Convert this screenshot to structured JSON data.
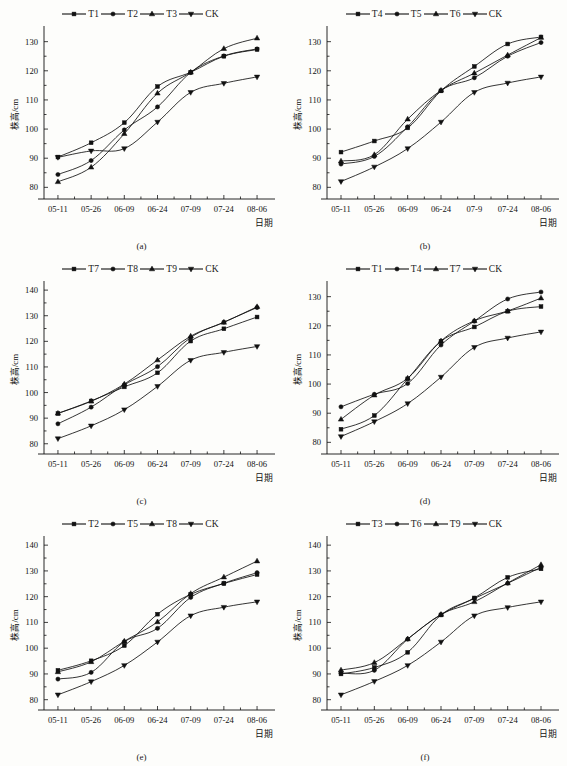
{
  "figure": {
    "y_axis_label": "株高/cm",
    "x_axis_label": "日期",
    "dates": [
      "05-11",
      "05-26",
      "06-09",
      "06-24",
      "07-09",
      "07-24",
      "08-06"
    ],
    "control_label": "CK",
    "footnote": ""
  },
  "chart_data": [
    {
      "type": "line",
      "panel": "a",
      "caption": "(a)",
      "title": "",
      "xlabel": "日期",
      "ylabel": "株高/cm",
      "x": [
        "05-11",
        "05-26",
        "06-09",
        "06-24",
        "07-09",
        "07-24",
        "08-06"
      ],
      "xticklabels": [
        "05-11",
        "05-26",
        "06-09",
        "06-24",
        "07-09",
        "07-24",
        "08-06"
      ],
      "yticklabels": [
        "80",
        "90",
        "100",
        "110",
        "120",
        "130"
      ],
      "ylim": [
        76,
        134
      ],
      "yticks": [
        80,
        90,
        100,
        110,
        120,
        130
      ],
      "grid": false,
      "legend_position": "top-center",
      "series": [
        {
          "name": "T1",
          "marker": "square",
          "values": [
            90.4,
            95.3,
            102.2,
            114.6,
            119.5,
            125.0,
            127.3
          ]
        },
        {
          "name": "T2",
          "marker": "circle",
          "values": [
            84.4,
            89.2,
            99.7,
            107.6,
            119.4,
            125.1,
            127.5
          ]
        },
        {
          "name": "T3",
          "marker": "triangle-up",
          "values": [
            81.9,
            86.9,
            98.4,
            112.3,
            119.5,
            127.6,
            131.2
          ]
        },
        {
          "name": "CK",
          "marker": "triangle-down",
          "values": [
            90.3,
            92.5,
            93.3,
            102.4,
            112.6,
            115.7,
            117.9
          ]
        }
      ]
    },
    {
      "type": "line",
      "panel": "b",
      "caption": "(b)",
      "title": "",
      "xlabel": "日期",
      "ylabel": "株高/cm",
      "x": [
        "05-11",
        "05-26",
        "06-09",
        "06-24",
        "07-9",
        "07-24",
        "08-06"
      ],
      "xticklabels": [
        "05-11",
        "05-26",
        "06-09",
        "06-24",
        "07-9",
        "07-24",
        "08-06"
      ],
      "yticklabels": [
        "80",
        "90",
        "100",
        "110",
        "120",
        "130"
      ],
      "ylim": [
        76,
        134
      ],
      "yticks": [
        80,
        90,
        100,
        110,
        120,
        130
      ],
      "grid": false,
      "legend_position": "top-center",
      "series": [
        {
          "name": "T4",
          "marker": "square",
          "values": [
            92.1,
            95.9,
            100.4,
            113.1,
            121.5,
            129.2,
            131.6
          ]
        },
        {
          "name": "T5",
          "marker": "circle",
          "values": [
            88.0,
            90.6,
            100.8,
            113.2,
            117.6,
            125.0,
            129.7
          ]
        },
        {
          "name": "T6",
          "marker": "triangle-up",
          "values": [
            89.0,
            91.2,
            103.4,
            113.3,
            119.2,
            125.4,
            131.4
          ]
        },
        {
          "name": "CK",
          "marker": "triangle-down",
          "values": [
            82.0,
            87.0,
            93.3,
            102.4,
            112.6,
            115.8,
            117.9
          ]
        }
      ]
    },
    {
      "type": "line",
      "panel": "c",
      "caption": "(c)",
      "title": "",
      "xlabel": "日期",
      "ylabel": "株高/cm",
      "x": [
        "05-11",
        "05-26",
        "06-09",
        "06-24",
        "07-09",
        "07-24",
        "08-06"
      ],
      "xticklabels": [
        "05-11",
        "05-26",
        "06-09",
        "06-24",
        "07-09",
        "07-24",
        "08-06"
      ],
      "yticklabels": [
        "80",
        "90",
        "100",
        "110",
        "120",
        "130",
        "140"
      ],
      "ylim": [
        76,
        142
      ],
      "yticks": [
        80,
        90,
        100,
        110,
        120,
        130,
        140
      ],
      "grid": false,
      "legend_position": "top-center",
      "series": [
        {
          "name": "T7",
          "marker": "square",
          "values": [
            91.8,
            96.7,
            102.2,
            107.7,
            120.1,
            124.9,
            129.5
          ]
        },
        {
          "name": "T8",
          "marker": "circle",
          "values": [
            87.8,
            94.3,
            103.0,
            110.1,
            121.5,
            127.5,
            133.2
          ]
        },
        {
          "name": "T9",
          "marker": "triangle-up",
          "values": [
            91.9,
            96.6,
            103.3,
            112.7,
            122.0,
            127.4,
            133.5
          ]
        },
        {
          "name": "CK",
          "marker": "triangle-down",
          "values": [
            82.0,
            87.0,
            93.3,
            102.4,
            112.6,
            115.7,
            118.0
          ]
        }
      ]
    },
    {
      "type": "line",
      "panel": "d",
      "caption": "(d)",
      "title": "",
      "xlabel": "日期",
      "ylabel": "株高/cm",
      "x": [
        "05-11",
        "05-26",
        "06-09",
        "06-24",
        "07-09",
        "07-24",
        "08-06"
      ],
      "xticklabels": [
        "05-11",
        "05-26",
        "06-09",
        "06-24",
        "07-09",
        "07-24",
        "08-06"
      ],
      "yticklabels": [
        "80",
        "90",
        "100",
        "110",
        "120",
        "130"
      ],
      "ylim": [
        76,
        134
      ],
      "yticks": [
        80,
        90,
        100,
        110,
        120,
        130
      ],
      "grid": false,
      "legend_position": "top-center",
      "series": [
        {
          "name": "T1",
          "marker": "square",
          "values": [
            84.5,
            89.2,
            101.8,
            114.7,
            119.6,
            125.0,
            126.6
          ]
        },
        {
          "name": "T4",
          "marker": "circle",
          "values": [
            92.2,
            96.5,
            100.2,
            113.4,
            121.6,
            129.2,
            131.6
          ]
        },
        {
          "name": "T7",
          "marker": "triangle-up",
          "values": [
            87.9,
            96.2,
            102.0,
            114.8,
            121.7,
            125.1,
            129.5
          ]
        },
        {
          "name": "CK",
          "marker": "triangle-down",
          "values": [
            82.0,
            87.1,
            93.3,
            102.4,
            112.6,
            115.8,
            117.9
          ]
        }
      ]
    },
    {
      "type": "line",
      "panel": "e",
      "caption": "(e)",
      "title": "",
      "xlabel": "日期",
      "ylabel": "株高/cm",
      "x": [
        "05-11",
        "05-26",
        "06-09",
        "06-24",
        "07-09",
        "07-24",
        "08-06"
      ],
      "xticklabels": [
        "05-11",
        "05-26",
        "06-09",
        "06-24",
        "07-09",
        "07-24",
        "08-06"
      ],
      "yticklabels": [
        "80",
        "90",
        "100",
        "110",
        "120",
        "130",
        "140"
      ],
      "ylim": [
        76,
        142
      ],
      "yticks": [
        80,
        90,
        100,
        110,
        120,
        130,
        140
      ],
      "grid": false,
      "legend_position": "top-center",
      "series": [
        {
          "name": "T2",
          "marker": "square",
          "values": [
            91.4,
            95.1,
            101.0,
            113.2,
            120.9,
            125.1,
            128.6
          ]
        },
        {
          "name": "T5",
          "marker": "circle",
          "values": [
            88.0,
            90.6,
            102.5,
            107.7,
            119.7,
            125.2,
            129.3
          ]
        },
        {
          "name": "T8",
          "marker": "triangle-up",
          "values": [
            90.8,
            94.7,
            102.7,
            110.2,
            121.2,
            127.6,
            133.8
          ]
        },
        {
          "name": "CK",
          "marker": "triangle-down",
          "values": [
            81.9,
            87.0,
            93.3,
            102.4,
            112.6,
            115.9,
            118.0
          ]
        }
      ]
    },
    {
      "type": "line",
      "panel": "f",
      "caption": "(f)",
      "title": "",
      "xlabel": "日期",
      "ylabel": "株高/cm",
      "x": [
        "05-11",
        "05-26",
        "06-09",
        "06-24",
        "07-09",
        "07-24",
        "08-06"
      ],
      "xticklabels": [
        "05-11",
        "05-26",
        "06-09",
        "06-24",
        "07-09",
        "07-24",
        "08-06"
      ],
      "yticklabels": [
        "80",
        "90",
        "100",
        "110",
        "120",
        "130",
        "140"
      ],
      "ylim": [
        76,
        142
      ],
      "yticks": [
        80,
        90,
        100,
        110,
        120,
        130,
        140
      ],
      "grid": false,
      "legend_position": "top-center",
      "series": [
        {
          "name": "T3",
          "marker": "square",
          "values": [
            90.0,
            92.5,
            98.4,
            112.9,
            119.5,
            127.5,
            130.8
          ]
        },
        {
          "name": "T6",
          "marker": "circle",
          "values": [
            90.3,
            91.4,
            103.5,
            113.0,
            119.3,
            125.2,
            131.4
          ]
        },
        {
          "name": "T9",
          "marker": "triangle-up",
          "values": [
            91.5,
            94.4,
            103.6,
            113.1,
            118.0,
            125.3,
            132.4
          ]
        },
        {
          "name": "CK",
          "marker": "triangle-down",
          "values": [
            81.9,
            87.1,
            93.3,
            102.4,
            112.6,
            115.8,
            118.0
          ]
        }
      ]
    }
  ]
}
